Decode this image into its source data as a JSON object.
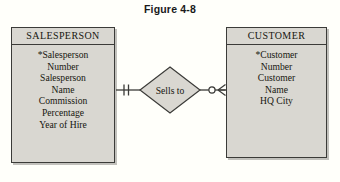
{
  "figure": {
    "title": "Figure 4-8",
    "type": "entity-relationship-diagram",
    "notation": "crows-foot"
  },
  "colors": {
    "page_background": "#fffffa",
    "entity_fill": "#d9d7d1",
    "diamond_fill": "#d9d7d1",
    "stroke": "#3b3b38",
    "text": "#16160f"
  },
  "entities": [
    {
      "id": "salesperson",
      "name": "SALESPERSON",
      "attributes": [
        {
          "text": "*Salesperson",
          "key": true
        },
        {
          "text": "Number",
          "key": false
        },
        {
          "text": "Salesperson",
          "key": false
        },
        {
          "text": "Name",
          "key": false
        },
        {
          "text": "Commission",
          "key": false
        },
        {
          "text": "Percentage",
          "key": false
        },
        {
          "text": "Year of Hire",
          "key": false
        }
      ]
    },
    {
      "id": "customer",
      "name": "CUSTOMER",
      "attributes": [
        {
          "text": "*Customer",
          "key": true
        },
        {
          "text": "Number",
          "key": false
        },
        {
          "text": "Customer",
          "key": false
        },
        {
          "text": "Name",
          "key": false
        },
        {
          "text": "HQ City",
          "key": false
        }
      ]
    }
  ],
  "relationship": {
    "label": "Sells to",
    "from": "SALESPERSON",
    "to": "CUSTOMER",
    "left_cardinality": "one-and-only-one",
    "left_symbol": "double-tick",
    "right_cardinality": "zero-or-many",
    "right_symbol": "circle-crows-foot"
  }
}
